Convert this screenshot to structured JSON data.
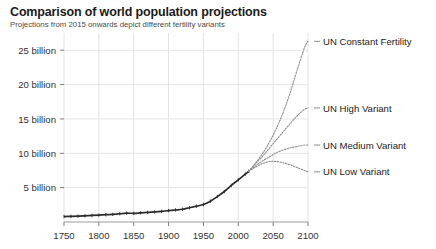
{
  "chart_data": {
    "type": "line",
    "title": "Comparison of world population projections",
    "subtitle": "Projections from 2015 onwards depict different fertility variants",
    "xlabel": "",
    "ylabel": "",
    "grid": true,
    "legend_position": "right-inline-labels",
    "xlim": [
      1750,
      2100
    ],
    "ylim": [
      0,
      27
    ],
    "xticks": [
      1750,
      1800,
      1850,
      1900,
      1950,
      2000,
      2050,
      2100
    ],
    "xticklabels": [
      "1750",
      "1800",
      "1850",
      "1900",
      "1950",
      "2000",
      "2050",
      "2100"
    ],
    "yticks": [
      5,
      10,
      15,
      20,
      25
    ],
    "yticklabels": [
      "5 billion",
      "10 billion",
      "15 billion",
      "20 billion",
      "25 billion"
    ],
    "value_unit": "billion people",
    "split_year": 2015,
    "series": [
      {
        "name": "Historical",
        "style": "solid-dark-markers",
        "x": [
          1750,
          1760,
          1770,
          1780,
          1790,
          1800,
          1810,
          1820,
          1830,
          1840,
          1850,
          1860,
          1870,
          1880,
          1890,
          1900,
          1910,
          1920,
          1930,
          1940,
          1950,
          1960,
          1970,
          1980,
          1990,
          2000,
          2010,
          2015
        ],
        "values": [
          0.79,
          0.82,
          0.86,
          0.9,
          0.95,
          1.0,
          1.06,
          1.12,
          1.2,
          1.28,
          1.26,
          1.33,
          1.4,
          1.47,
          1.55,
          1.65,
          1.75,
          1.86,
          2.07,
          2.3,
          2.54,
          3.03,
          3.7,
          4.44,
          5.33,
          6.14,
          6.96,
          7.38
        ]
      },
      {
        "name": "UN Constant Fertility",
        "style": "dotted-gray",
        "x": [
          2015,
          2025,
          2035,
          2045,
          2055,
          2065,
          2075,
          2085,
          2095,
          2100
        ],
        "values": [
          7.38,
          8.6,
          10.0,
          11.7,
          13.7,
          16.1,
          19.0,
          22.3,
          25.4,
          26.3
        ]
      },
      {
        "name": "UN High Variant",
        "style": "dotted-gray",
        "x": [
          2015,
          2025,
          2035,
          2045,
          2055,
          2065,
          2075,
          2085,
          2095,
          2100
        ],
        "values": [
          7.38,
          8.5,
          9.6,
          10.8,
          12.0,
          13.2,
          14.4,
          15.5,
          16.4,
          16.6
        ]
      },
      {
        "name": "UN Medium Variant",
        "style": "dotted-gray",
        "x": [
          2015,
          2025,
          2035,
          2045,
          2055,
          2065,
          2075,
          2085,
          2095,
          2100
        ],
        "values": [
          7.38,
          8.2,
          8.9,
          9.5,
          10.1,
          10.5,
          10.8,
          11.0,
          11.2,
          11.2
        ]
      },
      {
        "name": "UN Low Variant",
        "style": "dotted-gray",
        "x": [
          2015,
          2025,
          2035,
          2045,
          2055,
          2065,
          2075,
          2085,
          2095,
          2100
        ],
        "values": [
          7.38,
          8.0,
          8.5,
          8.8,
          8.8,
          8.6,
          8.3,
          7.9,
          7.5,
          7.3
        ]
      }
    ],
    "annotations": [
      {
        "label": "UN Constant Fertility",
        "value": 26.3,
        "year": 2100
      },
      {
        "label": "UN High Variant",
        "value": 16.6,
        "year": 2100
      },
      {
        "label": "UN Medium Variant",
        "value": 11.2,
        "year": 2100
      },
      {
        "label": "UN Low Variant",
        "value": 7.3,
        "year": 2100
      }
    ],
    "colors": {
      "historical": "#2b2b2b",
      "projection": "#8f8f8f",
      "grid": "#e4e4e4",
      "axis": "#9a9a9a",
      "text": "#222222",
      "background": "#ffffff"
    }
  }
}
